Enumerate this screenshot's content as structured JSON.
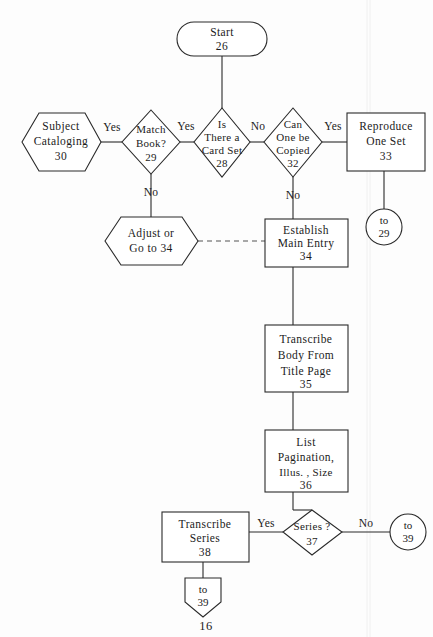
{
  "diagram": {
    "page_number": "16",
    "nodes": {
      "start": {
        "line1": "Start",
        "line2": "26",
        "shape": "stadium"
      },
      "subject_cataloging": {
        "line1": "Subject",
        "line2": "Cataloging",
        "line3": "30",
        "shape": "hexagon"
      },
      "match_book": {
        "line1": "Match",
        "line2": "Book?",
        "line3": "29",
        "shape": "diamond"
      },
      "card_set": {
        "line1": "Is",
        "line2": "There a",
        "line3": "Card Set",
        "line4": "28",
        "shape": "diamond"
      },
      "can_copy": {
        "line1": "Can",
        "line2": "One be",
        "line3": "Copied",
        "line4": "32",
        "shape": "diamond"
      },
      "reproduce": {
        "line1": "Reproduce",
        "line2": "One Set",
        "line3": "33",
        "shape": "rectangle"
      },
      "adjust": {
        "line1": "Adjust or",
        "line2": "Go to 34",
        "shape": "hexagon"
      },
      "main_entry": {
        "line1": "Establish",
        "line2": "Main Entry",
        "line3": "34",
        "shape": "rectangle"
      },
      "transcribe_body": {
        "line1": "Transcribe",
        "line2": "Body From",
        "line3": "Title Page",
        "line4": "35",
        "shape": "rectangle"
      },
      "list_pagination": {
        "line1": "List",
        "line2": "Pagination,",
        "line3": "Illus. ,   Size",
        "line4": "36",
        "shape": "rectangle"
      },
      "series": {
        "line1": "Series ?",
        "line2": "37",
        "shape": "diamond"
      },
      "transcribe_series": {
        "line1": "Transcribe",
        "line2": "Series",
        "line3": "38",
        "shape": "rectangle"
      },
      "to_29": {
        "line1": "to",
        "line2": "29",
        "shape": "circle"
      },
      "to_39_right": {
        "line1": "to",
        "line2": "39",
        "shape": "circle"
      },
      "to_39_bottom": {
        "line1": "to",
        "line2": "39",
        "shape": "pentagon"
      }
    },
    "edge_labels": {
      "subject_to_match": "Yes",
      "match_to_cardset": "Yes",
      "cardset_yes": "Yes",
      "cardset_no": "No",
      "match_no": "No",
      "cancopy_yes": "Yes",
      "cancopy_no": "No",
      "series_yes": "Yes",
      "series_no": "No"
    },
    "colors": {
      "stroke": "#2a2a2a",
      "fill": "#ffffff",
      "text": "#1b1b1b",
      "background": "#fdfdfd"
    }
  }
}
